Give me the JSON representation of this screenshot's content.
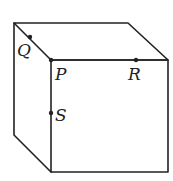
{
  "diagram": {
    "type": "cube",
    "stroke_color": "#222222",
    "vertices": {
      "back_top_left": [
        14,
        23
      ],
      "back_top_right": [
        128,
        23
      ],
      "front_top_left": [
        51,
        60
      ],
      "front_top_right": [
        168,
        60
      ],
      "front_bottom_left": [
        51,
        172
      ],
      "front_bottom_right": [
        168,
        172
      ],
      "back_bottom_left": [
        14,
        135
      ]
    },
    "points": [
      {
        "name": "Q",
        "label": "Q",
        "x": 30,
        "y": 37,
        "label_x": 17,
        "label_y": 55
      },
      {
        "name": "P",
        "label": "P",
        "x": 51,
        "y": 60,
        "label_x": 54,
        "label_y": 80
      },
      {
        "name": "R",
        "label": "R",
        "x": 136,
        "y": 60,
        "label_x": 128,
        "label_y": 80
      },
      {
        "name": "S",
        "label": "S",
        "x": 51,
        "y": 113,
        "label_x": 54,
        "label_y": 121
      }
    ]
  }
}
